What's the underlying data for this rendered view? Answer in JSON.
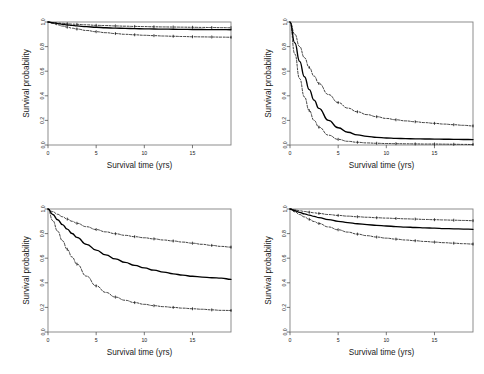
{
  "figure": {
    "background": "#ffffff",
    "layout": "2x2 grid of survival curve panels",
    "panel_count": 4
  },
  "axes": {
    "xlabel": "Survival time (yrs)",
    "ylabel": "Survival probability",
    "xticks": [
      "0",
      "5",
      "10",
      "15"
    ],
    "xtick_values": [
      0,
      5,
      10,
      15
    ],
    "yticks": [
      "0.0",
      "0.2",
      "0.4",
      "0.6",
      "0.8",
      "1.0"
    ],
    "ytick_values": [
      0.0,
      0.2,
      0.4,
      0.6,
      0.8,
      1.0
    ],
    "xlim": [
      0,
      19
    ],
    "ylim": [
      0,
      1.0
    ],
    "grid": false,
    "box": true,
    "line_color": "#000000",
    "box_color": "#808080"
  },
  "chart_data": [
    {
      "type": "line",
      "panel": "top-left",
      "title": "",
      "xlabel": "Survival time (yrs)",
      "ylabel": "Survival probability",
      "xlim": [
        0,
        19
      ],
      "ylim": [
        0,
        1.0
      ],
      "grid": false,
      "legend": "none",
      "x": [
        0,
        0.5,
        1,
        1.5,
        2,
        2.5,
        3,
        4,
        5,
        6,
        7,
        8,
        9,
        10,
        11,
        12,
        13,
        14,
        15,
        16,
        17,
        18,
        19
      ],
      "series": [
        {
          "name": "curve-upper",
          "style": "dotted-with-censor-ticks",
          "values": [
            1.0,
            0.996,
            0.992,
            0.989,
            0.986,
            0.983,
            0.981,
            0.977,
            0.973,
            0.971,
            0.968,
            0.966,
            0.964,
            0.963,
            0.961,
            0.96,
            0.959,
            0.958,
            0.957,
            0.956,
            0.955,
            0.954,
            0.953
          ]
        },
        {
          "name": "curve-middle",
          "style": "solid-bold",
          "values": [
            1.0,
            0.993,
            0.987,
            0.981,
            0.976,
            0.972,
            0.968,
            0.962,
            0.957,
            0.953,
            0.95,
            0.948,
            0.946,
            0.944,
            0.943,
            0.942,
            0.941,
            0.94,
            0.939,
            0.939,
            0.938,
            0.938,
            0.937
          ]
        },
        {
          "name": "curve-lower",
          "style": "dotted-with-censor-ticks",
          "values": [
            1.0,
            0.988,
            0.977,
            0.967,
            0.958,
            0.95,
            0.943,
            0.931,
            0.921,
            0.913,
            0.906,
            0.9,
            0.896,
            0.892,
            0.889,
            0.886,
            0.884,
            0.882,
            0.88,
            0.879,
            0.878,
            0.877,
            0.876
          ]
        }
      ]
    },
    {
      "type": "line",
      "panel": "top-right",
      "title": "",
      "xlabel": "Survival time (yrs)",
      "ylabel": "Survival probability",
      "xlim": [
        0,
        19
      ],
      "ylim": [
        0,
        1.0
      ],
      "grid": false,
      "legend": "none",
      "x": [
        0,
        0.5,
        1,
        1.5,
        2,
        2.5,
        3,
        4,
        5,
        6,
        7,
        8,
        9,
        10,
        11,
        12,
        13,
        14,
        15,
        16,
        17,
        18,
        19
      ],
      "series": [
        {
          "name": "curve-upper",
          "style": "dotted-with-censor-ticks",
          "values": [
            1.0,
            0.9,
            0.8,
            0.71,
            0.63,
            0.56,
            0.5,
            0.41,
            0.345,
            0.3,
            0.27,
            0.247,
            0.23,
            0.216,
            0.205,
            0.196,
            0.189,
            0.182,
            0.176,
            0.17,
            0.165,
            0.16,
            0.155
          ]
        },
        {
          "name": "curve-middle",
          "style": "solid-bold",
          "values": [
            1.0,
            0.83,
            0.68,
            0.555,
            0.45,
            0.365,
            0.298,
            0.2,
            0.14,
            0.104,
            0.082,
            0.07,
            0.062,
            0.057,
            0.054,
            0.052,
            0.05,
            0.049,
            0.048,
            0.047,
            0.046,
            0.045,
            0.044
          ]
        },
        {
          "name": "curve-lower",
          "style": "dotted-with-censor-ticks",
          "values": [
            1.0,
            0.74,
            0.54,
            0.39,
            0.28,
            0.2,
            0.145,
            0.08,
            0.046,
            0.03,
            0.022,
            0.017,
            0.014,
            0.012,
            0.011,
            0.01,
            0.009,
            0.008,
            0.008,
            0.007,
            0.006,
            0.005,
            0.004
          ]
        }
      ]
    },
    {
      "type": "line",
      "panel": "bottom-left",
      "title": "",
      "xlabel": "Survival time (yrs)",
      "ylabel": "Survival probability",
      "xlim": [
        0,
        19
      ],
      "ylim": [
        0,
        1.0
      ],
      "grid": false,
      "legend": "none",
      "x": [
        0,
        0.5,
        1,
        1.5,
        2,
        2.5,
        3,
        4,
        5,
        6,
        7,
        8,
        9,
        10,
        11,
        12,
        13,
        14,
        15,
        16,
        17,
        18,
        19
      ],
      "series": [
        {
          "name": "curve-upper",
          "style": "dotted-with-censor-ticks",
          "values": [
            1.0,
            0.978,
            0.957,
            0.937,
            0.918,
            0.9,
            0.884,
            0.856,
            0.833,
            0.814,
            0.799,
            0.786,
            0.775,
            0.766,
            0.757,
            0.748,
            0.74,
            0.731,
            0.722,
            0.713,
            0.704,
            0.696,
            0.69
          ]
        },
        {
          "name": "curve-middle",
          "style": "solid-bold",
          "values": [
            1.0,
            0.955,
            0.913,
            0.873,
            0.836,
            0.801,
            0.769,
            0.713,
            0.666,
            0.627,
            0.594,
            0.566,
            0.542,
            0.521,
            0.503,
            0.487,
            0.473,
            0.462,
            0.453,
            0.446,
            0.441,
            0.438,
            0.428
          ]
        },
        {
          "name": "curve-lower",
          "style": "dotted-with-censor-ticks",
          "values": [
            1.0,
            0.905,
            0.82,
            0.742,
            0.672,
            0.609,
            0.552,
            0.454,
            0.375,
            0.322,
            0.284,
            0.258,
            0.239,
            0.225,
            0.214,
            0.206,
            0.2,
            0.194,
            0.189,
            0.185,
            0.18,
            0.176,
            0.175
          ]
        }
      ]
    },
    {
      "type": "line",
      "panel": "bottom-right",
      "title": "",
      "xlabel": "Survival time (yrs)",
      "ylabel": "Survival probability",
      "xlim": [
        0,
        19
      ],
      "ylim": [
        0,
        1.0
      ],
      "grid": false,
      "legend": "none",
      "x": [
        0,
        0.5,
        1,
        1.5,
        2,
        2.5,
        3,
        4,
        5,
        6,
        7,
        8,
        9,
        10,
        11,
        12,
        13,
        14,
        15,
        16,
        17,
        18,
        19
      ],
      "series": [
        {
          "name": "curve-upper",
          "style": "dotted-with-censor-ticks",
          "values": [
            1.0,
            0.993,
            0.986,
            0.98,
            0.974,
            0.969,
            0.964,
            0.955,
            0.948,
            0.942,
            0.937,
            0.933,
            0.929,
            0.926,
            0.923,
            0.92,
            0.918,
            0.915,
            0.913,
            0.911,
            0.909,
            0.907,
            0.905
          ]
        },
        {
          "name": "curve-middle",
          "style": "solid-bold",
          "values": [
            1.0,
            0.986,
            0.973,
            0.961,
            0.95,
            0.94,
            0.93,
            0.914,
            0.9,
            0.889,
            0.88,
            0.873,
            0.867,
            0.862,
            0.857,
            0.853,
            0.85,
            0.847,
            0.844,
            0.841,
            0.839,
            0.837,
            0.835
          ]
        },
        {
          "name": "curve-lower",
          "style": "dotted-with-censor-ticks",
          "values": [
            1.0,
            0.977,
            0.955,
            0.935,
            0.916,
            0.898,
            0.882,
            0.854,
            0.831,
            0.812,
            0.796,
            0.783,
            0.772,
            0.763,
            0.755,
            0.748,
            0.742,
            0.736,
            0.731,
            0.726,
            0.722,
            0.718,
            0.715
          ]
        }
      ]
    }
  ]
}
